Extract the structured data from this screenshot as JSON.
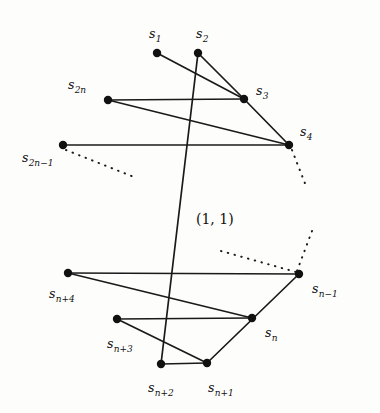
{
  "figure": {
    "background_color": "#fdfdfc",
    "stroke_color": "#1a1a1a",
    "dot_color": "#111111",
    "coordinate_annotation": "(1, 1)",
    "vertices": [
      {
        "id": "s1",
        "base": "s",
        "sub": "1",
        "x": 157,
        "y": 53,
        "label_x": 149,
        "label_y": 28
      },
      {
        "id": "s2",
        "base": "s",
        "sub": "2",
        "x": 198,
        "y": 53,
        "label_x": 196,
        "label_y": 28
      },
      {
        "id": "s3",
        "base": "s",
        "sub": "3",
        "x": 244,
        "y": 99,
        "label_x": 256,
        "label_y": 85
      },
      {
        "id": "s4",
        "base": "s",
        "sub": "4",
        "x": 289,
        "y": 145,
        "label_x": 300,
        "label_y": 126
      },
      {
        "id": "s2n",
        "base": "s",
        "sub": "2n",
        "x": 108,
        "y": 100,
        "label_x": 68,
        "label_y": 79
      },
      {
        "id": "s2n-1",
        "base": "s",
        "sub": "2n−1",
        "x": 63,
        "y": 145,
        "label_x": 22,
        "label_y": 152
      },
      {
        "id": "sn-1",
        "base": "s",
        "sub": "n−1",
        "x": 299,
        "y": 274,
        "label_x": 312,
        "label_y": 283
      },
      {
        "id": "sn",
        "base": "s",
        "sub": "n",
        "x": 252,
        "y": 318,
        "label_x": 265,
        "label_y": 327
      },
      {
        "id": "sn+1",
        "base": "s",
        "sub": "n+1",
        "x": 207,
        "y": 363,
        "label_x": 208,
        "label_y": 382
      },
      {
        "id": "sn+2",
        "base": "s",
        "sub": "n+2",
        "x": 161,
        "y": 364,
        "label_x": 148,
        "label_y": 382
      },
      {
        "id": "sn+3",
        "base": "s",
        "sub": "n+3",
        "x": 117,
        "y": 319,
        "label_x": 107,
        "label_y": 338
      },
      {
        "id": "sn+4",
        "base": "s",
        "sub": "n+4",
        "x": 68,
        "y": 273,
        "label_x": 49,
        "label_y": 288
      }
    ],
    "edges": [
      {
        "from": "s1",
        "to": "s3"
      },
      {
        "from": "s2",
        "to": "s3"
      },
      {
        "from": "s2",
        "to": "sn+2"
      },
      {
        "from": "s3",
        "to": "s4"
      },
      {
        "from": "s3",
        "to": "s2n"
      },
      {
        "from": "s2n",
        "to": "s4"
      },
      {
        "from": "s2n-1",
        "to": "s4"
      },
      {
        "from": "sn+4",
        "to": "sn-1"
      },
      {
        "from": "sn+4",
        "to": "sn"
      },
      {
        "from": "sn+3",
        "to": "sn"
      },
      {
        "from": "sn+3",
        "to": "sn+1"
      },
      {
        "from": "sn+2",
        "to": "sn+1"
      },
      {
        "from": "sn+1",
        "to": "sn-1"
      }
    ],
    "dotted_paths": [
      {
        "name": "lower-left-ellipsis",
        "x1": 66,
        "y1": 150,
        "x2": 134,
        "y2": 177
      },
      {
        "name": "upper-right-ellipsis",
        "x1": 292,
        "y1": 150,
        "x2": 306,
        "y2": 186
      },
      {
        "name": "mid-right-ellipsis",
        "x1": 221,
        "y1": 251,
        "x2": 296,
        "y2": 272
      },
      {
        "name": "right-ellipsis",
        "x1": 312,
        "y1": 231,
        "x2": 297,
        "y2": 271
      }
    ],
    "coord_label_pos": {
      "x": 196,
      "y": 212
    }
  }
}
